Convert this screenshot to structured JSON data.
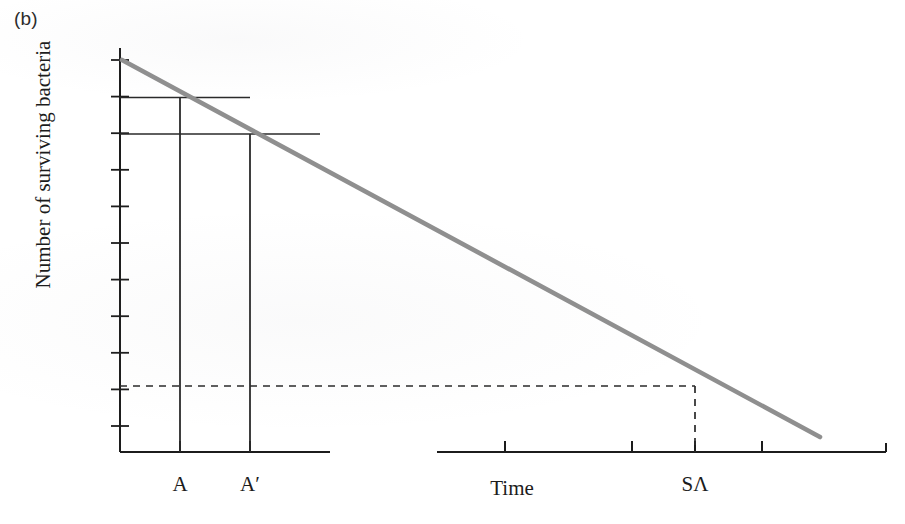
{
  "panel": {
    "label": "(b)"
  },
  "axes": {
    "ylabel": "Number of surviving bacteria",
    "xlabel": "Time",
    "y_tick_mantissa": "10",
    "y_ticks": [
      {
        "exp": "3"
      },
      {
        "exp": "2"
      },
      {
        "exp": "1"
      },
      {
        "exp": "0"
      },
      {
        "exp": "–1"
      },
      {
        "exp": "–2"
      },
      {
        "exp": "–3"
      },
      {
        "exp": "–4"
      },
      {
        "exp": "–5"
      },
      {
        "exp": "–6"
      },
      {
        "exp": "–7"
      }
    ],
    "x_tick_labels": [
      {
        "name": "A",
        "text": "A"
      },
      {
        "name": "A-prime",
        "text": "A′"
      },
      {
        "name": "SA",
        "text": "SΛ"
      }
    ]
  },
  "colors": {
    "curve": "#8f8f8f",
    "axis": "#1c1c1c",
    "construction": "#2a2a2a",
    "dashed": "#2a2a2a",
    "text": "#1c1c1c"
  },
  "chart_data": {
    "type": "line",
    "title": "",
    "subtitle": "",
    "xlabel": "Time",
    "ylabel": "Number of surviving bacteria",
    "yscale": "log",
    "ytick_labels": [
      "10^3",
      "10^2",
      "10^1",
      "10^0",
      "10^-1",
      "10^-2",
      "10^-3",
      "10^-4",
      "10^-5",
      "10^-6",
      "10^-7"
    ],
    "ytick_values": [
      1000,
      100,
      10,
      1,
      0.1,
      0.01,
      0.001,
      0.0001,
      1e-05,
      1e-06,
      1e-07
    ],
    "ylim": [
      1e-07,
      1000
    ],
    "grid": false,
    "legend": false,
    "axis_break": true,
    "series": [
      {
        "name": "Survivor curve",
        "color": "#8f8f8f",
        "x": [
          0,
          1.0
        ],
        "y_log10": [
          3,
          -7.6
        ],
        "description": "Straight semi-log inactivation line from 10^3 at time zero, decreasing one log per decimal reduction interval"
      }
    ],
    "annotations": [
      {
        "name": "decimal-reduction-upper",
        "type": "horizontal-line",
        "y_log10": 2,
        "label": "10^2 construction line from y-axis to curve"
      },
      {
        "name": "decimal-reduction-lower",
        "type": "horizontal-line",
        "y_log10": 1,
        "label": "10^1 construction line from y-axis to curve"
      },
      {
        "name": "drop-line-A",
        "type": "vertical-line",
        "x_label": "A",
        "from_log10": 2,
        "to": "x-axis"
      },
      {
        "name": "drop-line-A-prime",
        "type": "vertical-line",
        "x_label": "A′",
        "from_log10": 1,
        "to": "x-axis"
      },
      {
        "name": "sterility-level",
        "type": "dashed-horizontal-line",
        "y_log10": -6,
        "label": "10^-6 sterility assurance level"
      },
      {
        "name": "drop-line-SA",
        "type": "dashed-vertical-line",
        "x_label": "SΛ",
        "from_log10": -6,
        "to": "x-axis"
      }
    ]
  }
}
